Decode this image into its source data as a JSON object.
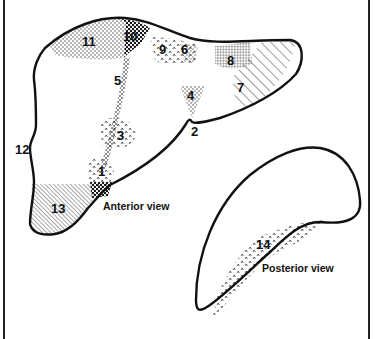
{
  "figure": {
    "views": {
      "anterior": {
        "label": "Anterior view"
      },
      "posterior": {
        "label": "Posterior view"
      }
    },
    "regions": [
      {
        "id": "1",
        "label": "1",
        "pattern": "carets-dots"
      },
      {
        "id": "2",
        "label": "2",
        "pattern": "none"
      },
      {
        "id": "3",
        "label": "3",
        "pattern": "carets"
      },
      {
        "id": "4",
        "label": "4",
        "pattern": "fine-dots"
      },
      {
        "id": "5",
        "label": "5",
        "pattern": "crosshatch-band"
      },
      {
        "id": "6",
        "label": "6",
        "pattern": "fine-dots"
      },
      {
        "id": "7",
        "label": "7",
        "pattern": "diagonal-lines-wide"
      },
      {
        "id": "8",
        "label": "8",
        "pattern": "dashes"
      },
      {
        "id": "9",
        "label": "9",
        "pattern": "carets"
      },
      {
        "id": "10",
        "label": "10",
        "pattern": "coarse-dots"
      },
      {
        "id": "11",
        "label": "11",
        "pattern": "fine-dots"
      },
      {
        "id": "12",
        "label": "12",
        "pattern": "none"
      },
      {
        "id": "13",
        "label": "13",
        "pattern": "diagonal-lines-dense"
      },
      {
        "id": "14",
        "label": "14",
        "pattern": "carets"
      }
    ],
    "colors": {
      "ink": "#111111",
      "background": "#ffffff"
    }
  }
}
